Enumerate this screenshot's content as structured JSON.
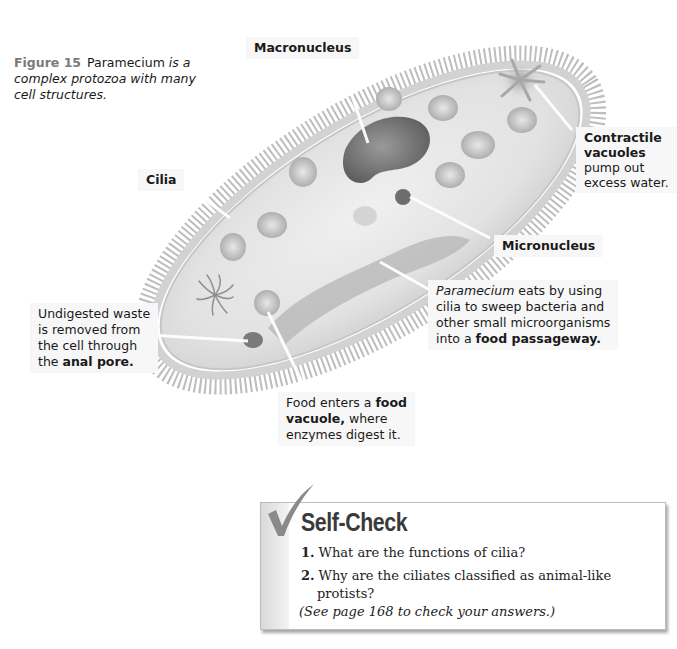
{
  "figure": {
    "number_label": "Figure 15",
    "caption_subject": "Paramecium",
    "caption_rest_line1": " is a",
    "caption_line2": "complex protozoa with many",
    "caption_line3": "cell structures."
  },
  "labels": {
    "macronucleus": "Macronucleus",
    "cilia": "Cilia",
    "contractile_title_1": "Contractile",
    "contractile_title_2": "vacuoles",
    "contractile_text_1": "pump out",
    "contractile_text_2": "excess water.",
    "micronucleus": "Micronucleus",
    "waste_1": "Undigested waste",
    "waste_2": "is removed from",
    "waste_3": "the cell through",
    "waste_4_pre": "the ",
    "waste_4_bold": "anal pore.",
    "eats_italic": "Paramecium",
    "eats_1_rest": " eats by using",
    "eats_2": "cilia to sweep bacteria and",
    "eats_3": "other small microorganisms",
    "eats_4_pre": "into a ",
    "eats_4_bold": "food passageway.",
    "food_1_pre": "Food enters a ",
    "food_1_bold": "food",
    "food_2_bold": "vacuole,",
    "food_2_rest": " where",
    "food_3": "enzymes digest it."
  },
  "self_check": {
    "title": "Self-Check",
    "icon": "checkmark-icon",
    "questions": [
      {
        "num": "1.",
        "text": "What are the functions of cilia?"
      },
      {
        "num": "2.",
        "text_line1": "Why are the ciliates classified as animal-like",
        "text_line2": "protists?"
      }
    ],
    "note": "(See page 168 to check your answers.)"
  },
  "colors": {
    "figure_label": "#7a7a7a",
    "cell_body": "#e4e4e4",
    "cilia": "#b8b8b8",
    "macronucleus": "#7d7d7d"
  }
}
